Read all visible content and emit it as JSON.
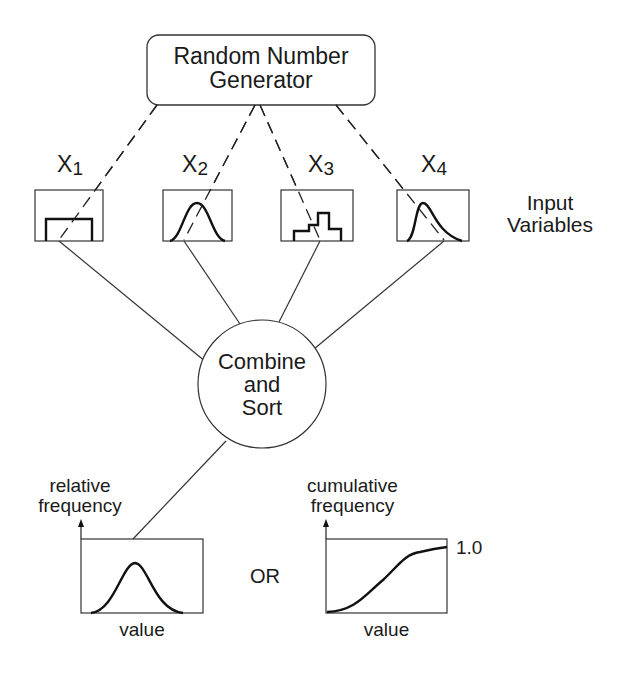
{
  "generator": {
    "title_line1": "Random Number",
    "title_line2": "Generator"
  },
  "input_variables": {
    "label_line1": "Input",
    "label_line2": "Variables",
    "items": [
      {
        "name": "X",
        "subscript": "1",
        "distribution": "uniform"
      },
      {
        "name": "X",
        "subscript": "2",
        "distribution": "normal"
      },
      {
        "name": "X",
        "subscript": "3",
        "distribution": "histogram"
      },
      {
        "name": "X",
        "subscript": "4",
        "distribution": "skewed"
      }
    ]
  },
  "combine_node": {
    "line1": "Combine",
    "line2": "and",
    "line3": "Sort"
  },
  "outputs": {
    "connector_text": "OR",
    "relative": {
      "ylabel_line1": "relative",
      "ylabel_line2": "frequency",
      "xlabel": "value",
      "curve": "bell"
    },
    "cumulative": {
      "ylabel_line1": "cumulative",
      "ylabel_line2": "frequency",
      "xlabel": "value",
      "max_label": "1.0",
      "curve": "s-curve"
    }
  },
  "colors": {
    "stroke": "#1a1a1a",
    "background": "#ffffff"
  }
}
